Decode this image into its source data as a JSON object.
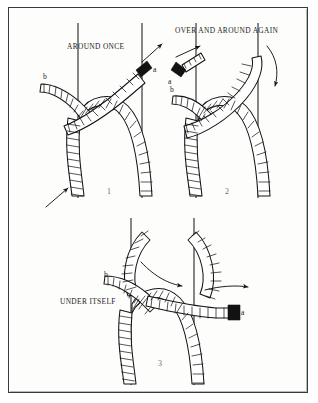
{
  "figure": {
    "border_color": "#3a3a3c",
    "background_color": "#fdfdfb",
    "ink_color": "#141414"
  },
  "panels": [
    {
      "number": "1",
      "caption": "AROUND ONCE",
      "labels": {
        "working_end": "a",
        "standing_end": "b"
      },
      "arrows": [
        "up-right from working end",
        "up-right at lower left"
      ]
    },
    {
      "number": "2",
      "caption": "OVER AND AROUND AGAIN",
      "labels": {
        "working_end": "a",
        "standing_end": "b"
      },
      "arrows": [
        "up-right at upper left",
        "curved down-right around post"
      ]
    },
    {
      "number": "3",
      "caption": "UNDER ITSELF",
      "labels": {
        "working_end": "a",
        "standing_end": "b"
      },
      "arrows": [
        "curved right across wrap",
        "straight right at working end"
      ]
    }
  ]
}
